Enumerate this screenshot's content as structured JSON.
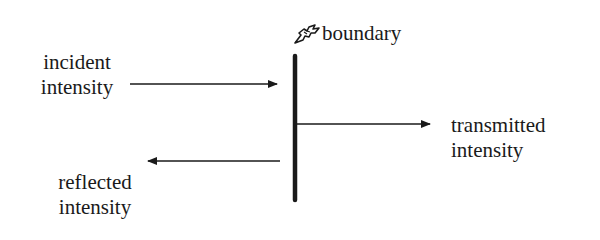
{
  "diagram": {
    "boundary": {
      "label": "boundary",
      "icon": "pointing-hand-icon"
    },
    "incident": {
      "line1": "incident",
      "line2": "intensity"
    },
    "transmitted": {
      "line1": "transmitted",
      "line2": "intensity"
    },
    "reflected": {
      "line1": "reflected",
      "line2": "intensity"
    },
    "colors": {
      "ink": "#1a1a1a",
      "background": "#ffffff"
    }
  }
}
